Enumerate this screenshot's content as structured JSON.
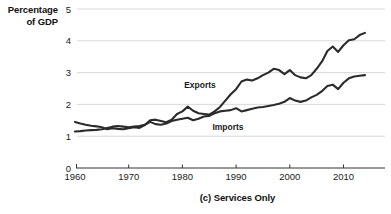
{
  "axis_title_lines": [
    "Percentage",
    "of GDP"
  ],
  "caption": "(c) Services Only",
  "labels": {
    "exports": "Exports",
    "imports": "Imports"
  },
  "ytick_labels": [
    "5",
    "4",
    "3",
    "2",
    "1",
    "0"
  ],
  "xtick_labels": [
    "1960",
    "1970",
    "1980",
    "1990",
    "2000",
    "2010"
  ],
  "colors": {
    "line": "#2b2b2b",
    "grid": "#c8c8c8",
    "axis": "#333333",
    "text": "#111111",
    "background": "#ffffff"
  },
  "chart_data": {
    "type": "line",
    "title": "(c) Services Only",
    "xlabel": "",
    "ylabel": "Percentage of GDP",
    "xlim": [
      1960,
      2014
    ],
    "ylim": [
      0,
      5
    ],
    "yticks": [
      0,
      1,
      2,
      3,
      4,
      5
    ],
    "xticks": [
      1960,
      1970,
      1980,
      1990,
      2000,
      2010
    ],
    "grid": "horizontal",
    "legend": "inline-annotations",
    "x": [
      1960,
      1961,
      1962,
      1963,
      1964,
      1965,
      1966,
      1967,
      1968,
      1969,
      1970,
      1971,
      1972,
      1973,
      1974,
      1975,
      1976,
      1977,
      1978,
      1979,
      1980,
      1981,
      1982,
      1983,
      1984,
      1985,
      1986,
      1987,
      1988,
      1989,
      1990,
      1991,
      1992,
      1993,
      1994,
      1995,
      1996,
      1997,
      1998,
      1999,
      2000,
      2001,
      2002,
      2003,
      2004,
      2005,
      2006,
      2007,
      2008,
      2009,
      2010,
      2011,
      2012,
      2013,
      2014
    ],
    "series": [
      {
        "name": "Exports",
        "values": [
          1.45,
          1.4,
          1.36,
          1.33,
          1.31,
          1.28,
          1.22,
          1.25,
          1.23,
          1.22,
          1.25,
          1.28,
          1.26,
          1.35,
          1.5,
          1.52,
          1.48,
          1.44,
          1.52,
          1.7,
          1.78,
          1.93,
          1.8,
          1.72,
          1.7,
          1.68,
          1.78,
          1.92,
          2.12,
          2.32,
          2.48,
          2.72,
          2.78,
          2.75,
          2.82,
          2.92,
          3.0,
          3.12,
          3.08,
          2.95,
          3.08,
          2.92,
          2.85,
          2.82,
          2.92,
          3.12,
          3.35,
          3.68,
          3.82,
          3.65,
          3.86,
          4.02,
          4.05,
          4.18,
          4.25
        ]
      },
      {
        "name": "Imports",
        "values": [
          1.15,
          1.16,
          1.18,
          1.19,
          1.2,
          1.22,
          1.26,
          1.3,
          1.32,
          1.3,
          1.28,
          1.3,
          1.32,
          1.36,
          1.45,
          1.38,
          1.36,
          1.4,
          1.48,
          1.52,
          1.55,
          1.58,
          1.5,
          1.55,
          1.62,
          1.64,
          1.72,
          1.78,
          1.8,
          1.82,
          1.88,
          1.78,
          1.82,
          1.86,
          1.9,
          1.92,
          1.95,
          1.98,
          2.02,
          2.08,
          2.2,
          2.12,
          2.08,
          2.12,
          2.22,
          2.3,
          2.42,
          2.58,
          2.62,
          2.48,
          2.68,
          2.82,
          2.88,
          2.9,
          2.92
        ]
      }
    ],
    "annotations": [
      {
        "text": "Exports",
        "x_px": 200,
        "y_px": 88
      },
      {
        "text": "Imports",
        "x_px": 228,
        "y_px": 130
      }
    ]
  }
}
